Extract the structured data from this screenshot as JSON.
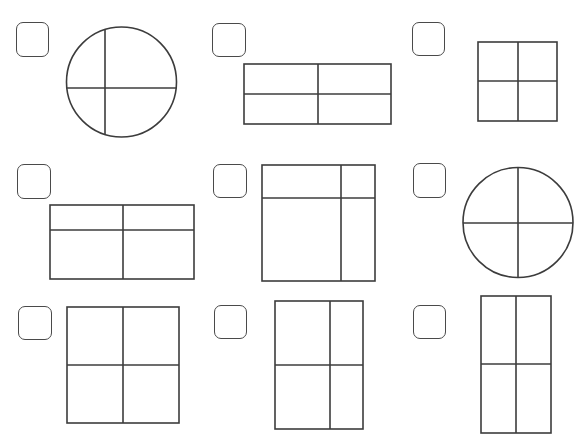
{
  "page": {
    "background": "#ffffff",
    "stroke_color": "#3c3c3c"
  },
  "items": [
    {
      "id": 1,
      "shape": "circle",
      "description": "circle divided into 4 unequal parts",
      "checked": false,
      "checkbox": {
        "x": 16,
        "y": 22,
        "w": 33,
        "h": 35
      },
      "geom": {
        "cx": 121.5,
        "cy": 82,
        "r": 55,
        "vline_x": 105,
        "hline_y": 88
      }
    },
    {
      "id": 2,
      "shape": "rect",
      "description": "rectangle divided into 4 equal parts",
      "checked": false,
      "checkbox": {
        "x": 212,
        "y": 23,
        "w": 34,
        "h": 34
      },
      "geom": {
        "x1": 244,
        "y1": 64,
        "x2": 391,
        "y2": 124,
        "vline_x": 318,
        "hline_y": 94
      }
    },
    {
      "id": 3,
      "shape": "rect",
      "description": "square divided into 4 equal parts",
      "checked": false,
      "checkbox": {
        "x": 412,
        "y": 22,
        "w": 33,
        "h": 34
      },
      "geom": {
        "x1": 478,
        "y1": 42,
        "x2": 557,
        "y2": 121,
        "vline_x": 518,
        "hline_y": 81
      }
    },
    {
      "id": 4,
      "shape": "rect",
      "description": "rectangle divided into 4 unequal parts",
      "checked": false,
      "checkbox": {
        "x": 17,
        "y": 164,
        "w": 34,
        "h": 35
      },
      "geom": {
        "x1": 50,
        "y1": 205,
        "x2": 194,
        "y2": 279,
        "vline_x": 123,
        "hline_y": 230
      }
    },
    {
      "id": 5,
      "shape": "rect",
      "description": "square divided into 4 unequal parts",
      "checked": false,
      "checkbox": {
        "x": 213,
        "y": 164,
        "w": 34,
        "h": 34
      },
      "geom": {
        "x1": 262,
        "y1": 165,
        "x2": 375,
        "y2": 281,
        "vline_x": 341,
        "hline_y": 198
      }
    },
    {
      "id": 6,
      "shape": "circle",
      "description": "circle divided into 4 equal parts",
      "checked": false,
      "checkbox": {
        "x": 413,
        "y": 163,
        "w": 33,
        "h": 35
      },
      "geom": {
        "cx": 518,
        "cy": 222.5,
        "r": 55,
        "vline_x": 518,
        "hline_y": 223
      }
    },
    {
      "id": 7,
      "shape": "rect",
      "description": "square divided into 4 equal parts",
      "checked": false,
      "checkbox": {
        "x": 18,
        "y": 306,
        "w": 34,
        "h": 34
      },
      "geom": {
        "x1": 67,
        "y1": 307,
        "x2": 179,
        "y2": 423,
        "vline_x": 123,
        "hline_y": 365
      }
    },
    {
      "id": 8,
      "shape": "rect",
      "description": "rectangle divided into 4 unequal parts",
      "checked": false,
      "checkbox": {
        "x": 214,
        "y": 305,
        "w": 33,
        "h": 34
      },
      "geom": {
        "x1": 275,
        "y1": 301,
        "x2": 363,
        "y2": 429,
        "vline_x": 330,
        "hline_y": 365
      }
    },
    {
      "id": 9,
      "shape": "rect",
      "description": "rectangle divided into 4 equal parts",
      "checked": false,
      "checkbox": {
        "x": 413,
        "y": 305,
        "w": 33,
        "h": 34
      },
      "geom": {
        "x1": 481,
        "y1": 296,
        "x2": 551,
        "y2": 433,
        "vline_x": 516,
        "hline_y": 364
      }
    }
  ]
}
